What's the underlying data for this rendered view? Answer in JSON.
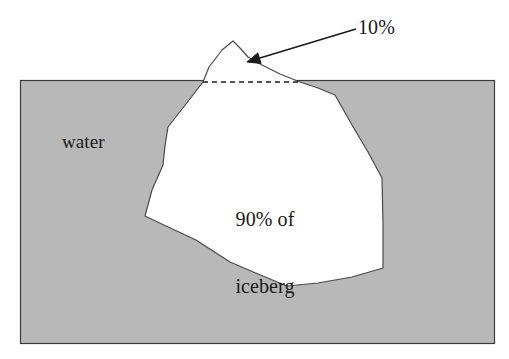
{
  "figure": {
    "background_color": "#ffffff",
    "width": 509,
    "height": 359
  },
  "water": {
    "label": "water",
    "fill_color": "#b8b8b8",
    "border_color": "#3c3c3c",
    "rect": {
      "x": 20,
      "y": 80,
      "width": 474,
      "height": 263
    }
  },
  "iceberg": {
    "fill_color": "#ffffff",
    "outline_color": "#4a4a4a",
    "submerged_label_line1": "90% of",
    "submerged_label_line2": "iceberg",
    "exposed_label": "10%",
    "waterline": {
      "style": "dashed",
      "color": "#1a1a1a",
      "x1": 203,
      "x2": 300,
      "y": 82
    },
    "outline_points": "203,82 209,67 222,50 233,41 240,48 248,57 262,65 280,74 300,82 318,88 335,95 352,125 368,152 382,178 383,225 383,268 352,277 318,283 287,286 258,274 230,262 196,240 166,226 145,216 152,190 163,165 165,146 168,127 186,104 203,82"
  },
  "annotation": {
    "arrow": {
      "label": "10%",
      "color": "#1a1a1a",
      "tail_x": 356,
      "tail_y": 29,
      "tip_x": 247,
      "tip_y": 62
    }
  }
}
